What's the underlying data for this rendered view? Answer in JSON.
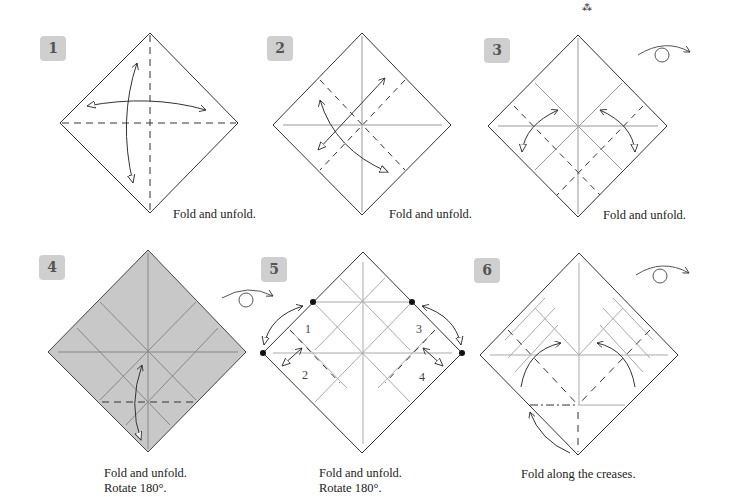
{
  "page": {
    "top_mark": "⁂"
  },
  "steps": [
    {
      "number": "1",
      "caption": [
        "Fold and unfold."
      ]
    },
    {
      "number": "2",
      "caption": [
        "Fold and unfold."
      ]
    },
    {
      "number": "3",
      "caption": [
        "Fold and unfold."
      ],
      "symbol": "turn-over"
    },
    {
      "number": "4",
      "caption": [
        "Fold and unfold.",
        "Rotate 180°."
      ],
      "paper_color": "#c8c8c8"
    },
    {
      "number": "5",
      "caption": [
        "Fold and unfold.",
        "Rotate 180°."
      ],
      "symbol": "turn-over",
      "labels": [
        "1",
        "2",
        "3",
        "4"
      ]
    },
    {
      "number": "6",
      "caption": [
        "Fold along the creases."
      ],
      "symbol": "turn-over"
    }
  ],
  "colors": {
    "badge": "#cfcfcf",
    "line": "#333333",
    "crease": "#8a8a8a",
    "paper_colored": "#c8c8c8"
  }
}
